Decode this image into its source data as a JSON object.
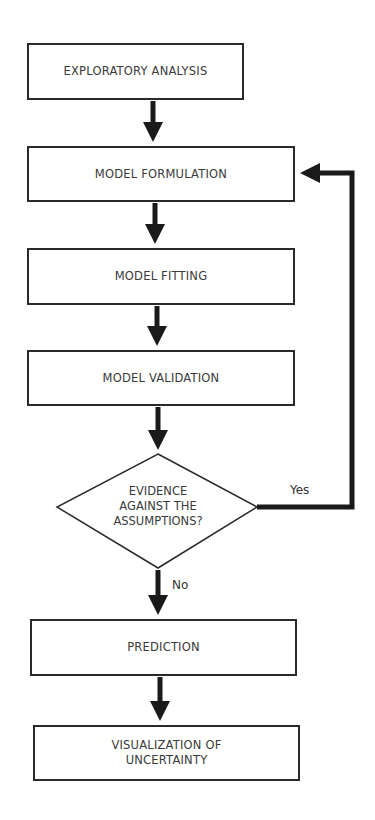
{
  "diagram": {
    "nodes": [
      {
        "id": "exploratory",
        "label": "EXPLORATORY ANALYSIS"
      },
      {
        "id": "formulation",
        "label": "MODEL FORMULATION"
      },
      {
        "id": "fitting",
        "label": "MODEL FITTING"
      },
      {
        "id": "validation",
        "label": "MODEL VALIDATION"
      },
      {
        "id": "decision",
        "label_lines": [
          "EVIDENCE",
          "AGAINST THE",
          "ASSUMPTIONS?"
        ]
      },
      {
        "id": "prediction",
        "label": "PREDICTION"
      },
      {
        "id": "visualization",
        "label_lines": [
          "VISUALIZATION OF",
          "UNCERTAINTY"
        ]
      }
    ],
    "edges": [
      {
        "from": "exploratory",
        "to": "formulation"
      },
      {
        "from": "formulation",
        "to": "fitting"
      },
      {
        "from": "fitting",
        "to": "validation"
      },
      {
        "from": "validation",
        "to": "decision"
      },
      {
        "from": "decision",
        "to": "formulation",
        "label": "Yes"
      },
      {
        "from": "decision",
        "to": "prediction",
        "label": "No"
      },
      {
        "from": "prediction",
        "to": "visualization"
      }
    ],
    "colors": {
      "stroke": "#2a2a2a",
      "text": "#3a3a3a"
    }
  }
}
